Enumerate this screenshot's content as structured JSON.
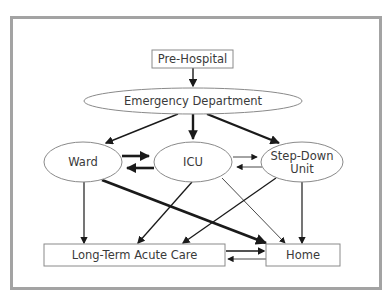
{
  "diagram": {
    "type": "flow",
    "nodes": [
      {
        "id": "prehospital",
        "label": "Pre-Hospital",
        "shape": "rect"
      },
      {
        "id": "ed",
        "label": "Emergency Department",
        "shape": "ellipse"
      },
      {
        "id": "ward",
        "label": "Ward",
        "shape": "ellipse"
      },
      {
        "id": "icu",
        "label": "ICU",
        "shape": "ellipse"
      },
      {
        "id": "stepdown",
        "label_line1": "Step-Down",
        "label_line2": "Unit",
        "shape": "ellipse"
      },
      {
        "id": "ltac",
        "label": "Long-Term Acute Care",
        "shape": "rect"
      },
      {
        "id": "home",
        "label": "Home",
        "shape": "rect"
      }
    ],
    "edges": [
      {
        "from": "prehospital",
        "to": "ed",
        "weight": "medium"
      },
      {
        "from": "ed",
        "to": "ward",
        "weight": "medium"
      },
      {
        "from": "ed",
        "to": "icu",
        "weight": "heavy"
      },
      {
        "from": "ed",
        "to": "stepdown",
        "weight": "heavy"
      },
      {
        "from": "ward",
        "to": "icu",
        "weight": "heavy"
      },
      {
        "from": "icu",
        "to": "ward",
        "weight": "heavy"
      },
      {
        "from": "icu",
        "to": "stepdown",
        "weight": "thin"
      },
      {
        "from": "stepdown",
        "to": "icu",
        "weight": "thin"
      },
      {
        "from": "ward",
        "to": "ltac",
        "weight": "medium"
      },
      {
        "from": "ward",
        "to": "home",
        "weight": "heavy"
      },
      {
        "from": "icu",
        "to": "ltac",
        "weight": "medium"
      },
      {
        "from": "icu",
        "to": "home",
        "weight": "thin"
      },
      {
        "from": "stepdown",
        "to": "ltac",
        "weight": "medium"
      },
      {
        "from": "stepdown",
        "to": "home",
        "weight": "medium"
      },
      {
        "from": "ltac",
        "to": "home",
        "weight": "medium"
      },
      {
        "from": "home",
        "to": "ltac",
        "weight": "thin"
      }
    ]
  },
  "colors": {
    "frame": "#a3a3a3",
    "node_stroke": "#8a8a8a",
    "edge": "#1a1a1a",
    "text": "#3a3a3a"
  }
}
